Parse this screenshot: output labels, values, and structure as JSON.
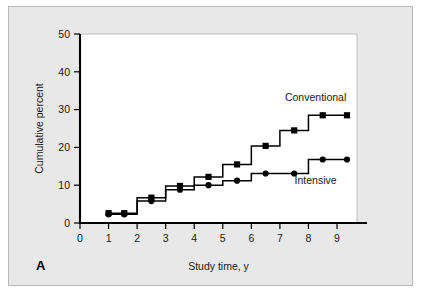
{
  "figure": {
    "panel_label": "A",
    "background_color": "#e8e8e8",
    "plot_background_color": "#ffffff",
    "border_color": "#b8b8b8"
  },
  "chart_data": {
    "type": "line",
    "title": "",
    "subtitle": "",
    "xlabel": "Study time, y",
    "ylabel": "Cumulative percent",
    "xlim": [
      0,
      9.7
    ],
    "ylim": [
      0,
      50
    ],
    "xticks": [
      0,
      1,
      2,
      3,
      4,
      5,
      6,
      7,
      8,
      9
    ],
    "xtick_labels": [
      "0",
      "1",
      "2",
      "3",
      "4",
      "5",
      "6",
      "7",
      "8",
      "9"
    ],
    "yticks": [
      0,
      10,
      20,
      30,
      40,
      50
    ],
    "ytick_labels": [
      "0",
      "10",
      "20",
      "30",
      "40",
      "50"
    ],
    "grid": false,
    "legend_position": "inline-right",
    "line_color": "#000000",
    "series": [
      {
        "name": "Conventional",
        "marker": "square",
        "label_x": 8.25,
        "label_y": 32.2,
        "steps": [
          {
            "x": 1.0,
            "y": 2.6
          },
          {
            "x": 1.55,
            "y": 2.6
          },
          {
            "x": 2.0,
            "y": 2.6
          },
          {
            "x": 2.0,
            "y": 6.7
          },
          {
            "x": 2.5,
            "y": 6.7
          },
          {
            "x": 3.0,
            "y": 6.7
          },
          {
            "x": 3.0,
            "y": 9.8
          },
          {
            "x": 3.5,
            "y": 9.8
          },
          {
            "x": 4.0,
            "y": 9.8
          },
          {
            "x": 4.0,
            "y": 12.2
          },
          {
            "x": 4.5,
            "y": 12.2
          },
          {
            "x": 5.0,
            "y": 12.2
          },
          {
            "x": 5.0,
            "y": 15.5
          },
          {
            "x": 5.5,
            "y": 15.5
          },
          {
            "x": 6.0,
            "y": 15.5
          },
          {
            "x": 6.0,
            "y": 20.4
          },
          {
            "x": 6.5,
            "y": 20.4
          },
          {
            "x": 7.0,
            "y": 20.4
          },
          {
            "x": 7.0,
            "y": 24.5
          },
          {
            "x": 7.5,
            "y": 24.5
          },
          {
            "x": 8.0,
            "y": 24.5
          },
          {
            "x": 8.0,
            "y": 28.5
          },
          {
            "x": 8.5,
            "y": 28.5
          },
          {
            "x": 9.35,
            "y": 28.5
          }
        ],
        "markers": [
          {
            "x": 1.0,
            "y": 2.6
          },
          {
            "x": 1.55,
            "y": 2.6
          },
          {
            "x": 2.5,
            "y": 6.7
          },
          {
            "x": 3.5,
            "y": 9.8
          },
          {
            "x": 4.5,
            "y": 12.2
          },
          {
            "x": 5.5,
            "y": 15.5
          },
          {
            "x": 6.5,
            "y": 20.4
          },
          {
            "x": 7.5,
            "y": 24.5
          },
          {
            "x": 8.5,
            "y": 28.5
          },
          {
            "x": 9.35,
            "y": 28.5
          }
        ]
      },
      {
        "name": "Intensive",
        "marker": "circle",
        "label_x": 8.25,
        "label_y": 10.4,
        "steps": [
          {
            "x": 1.0,
            "y": 2.3
          },
          {
            "x": 1.55,
            "y": 2.3
          },
          {
            "x": 2.0,
            "y": 2.3
          },
          {
            "x": 2.0,
            "y": 5.8
          },
          {
            "x": 2.5,
            "y": 5.8
          },
          {
            "x": 3.0,
            "y": 5.8
          },
          {
            "x": 3.0,
            "y": 8.8
          },
          {
            "x": 3.5,
            "y": 8.8
          },
          {
            "x": 4.0,
            "y": 8.8
          },
          {
            "x": 4.0,
            "y": 10.0
          },
          {
            "x": 4.5,
            "y": 10.0
          },
          {
            "x": 5.0,
            "y": 10.0
          },
          {
            "x": 5.0,
            "y": 11.2
          },
          {
            "x": 5.5,
            "y": 11.2
          },
          {
            "x": 6.0,
            "y": 11.2
          },
          {
            "x": 6.0,
            "y": 13.1
          },
          {
            "x": 6.5,
            "y": 13.1
          },
          {
            "x": 7.5,
            "y": 13.1
          },
          {
            "x": 8.0,
            "y": 13.1
          },
          {
            "x": 8.0,
            "y": 16.8
          },
          {
            "x": 8.5,
            "y": 16.8
          },
          {
            "x": 9.35,
            "y": 16.8
          }
        ],
        "markers": [
          {
            "x": 1.0,
            "y": 2.3
          },
          {
            "x": 1.55,
            "y": 2.3
          },
          {
            "x": 2.5,
            "y": 5.8
          },
          {
            "x": 3.5,
            "y": 8.8
          },
          {
            "x": 4.5,
            "y": 10.0
          },
          {
            "x": 5.5,
            "y": 11.2
          },
          {
            "x": 6.5,
            "y": 13.1
          },
          {
            "x": 7.5,
            "y": 13.1
          },
          {
            "x": 8.5,
            "y": 16.8
          },
          {
            "x": 9.35,
            "y": 16.8
          }
        ]
      }
    ]
  }
}
